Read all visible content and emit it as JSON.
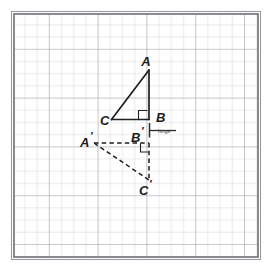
{
  "diagram": {
    "background_color": "#ffffff",
    "grid": {
      "origin_x": 14,
      "origin_y": 14,
      "cell_size": 12.2,
      "cols": 20,
      "rows": 20,
      "line_color": "#c9c9cf",
      "major_line_color": "#a9a9b2",
      "major_every": 4,
      "border_color": "#6b6b70",
      "border_outer_color": "#8d8d93"
    },
    "hinge": {
      "label": "hinge",
      "label_x": 158,
      "label_y": 132,
      "line_x1": 149,
      "line_x2": 176,
      "line_y": 130.5,
      "tick_x": 149,
      "tick_y1": 124,
      "tick_y2": 137,
      "color": "#2a2a2a"
    },
    "stroke_color": "#1f1f1f",
    "triangles": [
      {
        "name": "triangle-abc",
        "style": "solid",
        "vertices": [
          {
            "id": "A",
            "label": "A",
            "prime": false,
            "x": 149,
            "y": 70,
            "label_x": 150,
            "label_y": 64
          },
          {
            "id": "B",
            "label": "B",
            "prime": false,
            "x": 149,
            "y": 119,
            "label_x": 155,
            "label_y": 120
          },
          {
            "id": "C",
            "label": "C",
            "prime": false,
            "x": 112,
            "y": 119,
            "label_x": 102,
            "label_y": 124
          }
        ],
        "right_angle_at": "B",
        "right_angle_marker": {
          "x": 138,
          "y": 108,
          "size": 7,
          "corner": "bottom-right"
        }
      },
      {
        "name": "triangle-a-prime-b-prime-c-prime",
        "style": "dashed",
        "vertices": [
          {
            "id": "A'",
            "label": "A",
            "prime": true,
            "x": 94,
            "y": 143,
            "label_x": 82,
            "label_y": 143
          },
          {
            "id": "B'",
            "label": "B",
            "prime": true,
            "x": 149,
            "y": 143,
            "label_x": 134,
            "label_y": 138
          },
          {
            "id": "C'",
            "label": "C",
            "prime": true,
            "x": 149,
            "y": 180,
            "label_x": 142,
            "label_y": 193
          }
        ],
        "right_angle_at": "B'",
        "right_angle_marker": {
          "x": 141,
          "y": 143,
          "size": 7,
          "corner": "top-right"
        }
      }
    ],
    "labels": {
      "A": "A",
      "B": "B",
      "C": "C",
      "A_prime": "A",
      "B_prime": "B",
      "C_prime": "C",
      "prime_mark": "′"
    }
  }
}
